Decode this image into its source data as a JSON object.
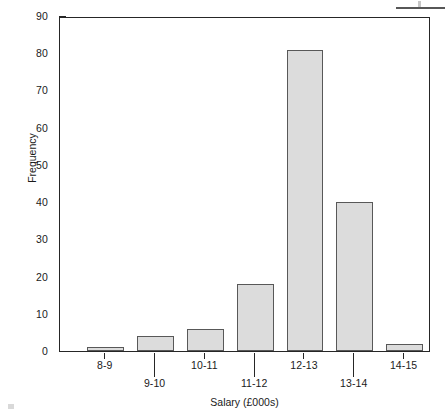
{
  "chart_data": {
    "type": "bar",
    "title": "",
    "subtitle": "",
    "xlabel": "Salary (£000s)",
    "ylabel": "Frequency",
    "categories": [
      "8-9",
      "9-10",
      "10-11",
      "11-12",
      "12-13",
      "13-14",
      "14-15"
    ],
    "values": [
      1,
      4,
      6,
      18,
      81,
      40,
      2
    ],
    "series": [
      {
        "name": "Frequency",
        "values": [
          1,
          4,
          6,
          18,
          81,
          40,
          2
        ]
      }
    ],
    "ylim": [
      0,
      90
    ],
    "ytick_labels": [
      "0",
      "10",
      "20",
      "30",
      "40",
      "50",
      "60",
      "70",
      "80",
      "90"
    ],
    "ytick_values": [
      0,
      10,
      20,
      30,
      40,
      50,
      60,
      70,
      80,
      90
    ],
    "grid": false,
    "legend": "none",
    "bar_fill_color": "#dcdcdc",
    "bar_edge_color": "#585858",
    "axis_color": "#262626",
    "background_color": "#ffffff",
    "label_rows": [
      0,
      1,
      0,
      1,
      0,
      1,
      0
    ]
  }
}
